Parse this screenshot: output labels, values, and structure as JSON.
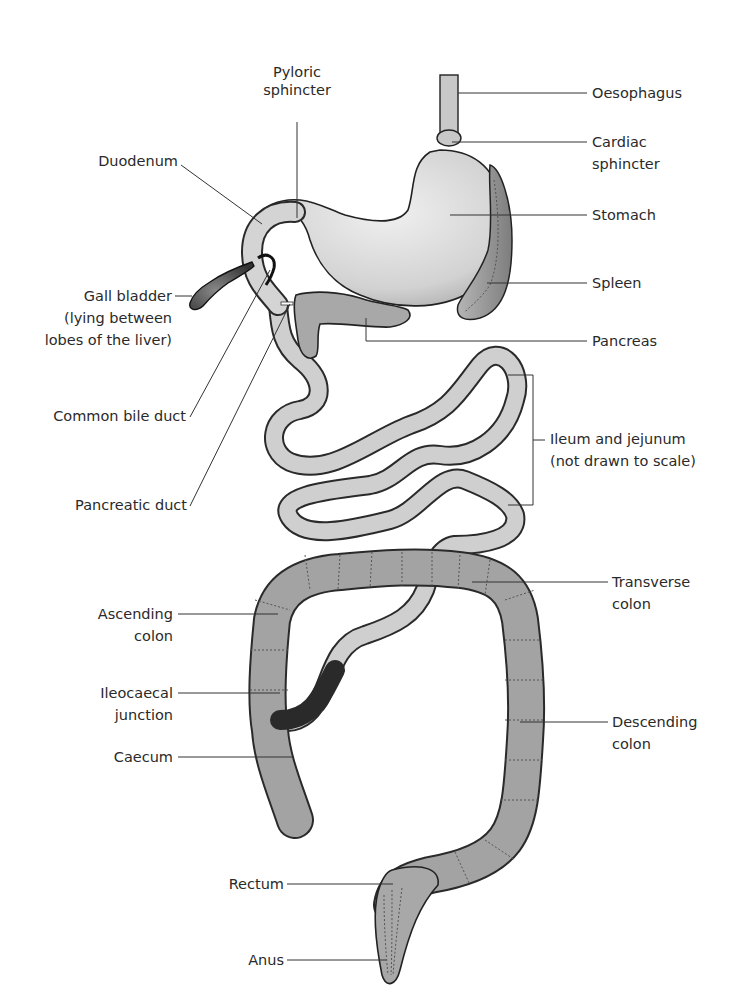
{
  "diagram": {
    "labels": {
      "pyloric_sphincter": [
        "Pyloric",
        "sphincter"
      ],
      "oesophagus": "Oesophagus",
      "cardiac_sphincter": [
        "Cardiac",
        "sphincter"
      ],
      "duodenum": "Duodenum",
      "stomach": "Stomach",
      "spleen": "Spleen",
      "gall_bladder": [
        "Gall bladder",
        "(lying between",
        "lobes of the liver)"
      ],
      "pancreas": "Pancreas",
      "common_bile_duct": "Common bile duct",
      "ileum_jejunum": [
        "Ileum and jejunum",
        "(not drawn to scale)"
      ],
      "pancreatic_duct": "Pancreatic duct",
      "transverse_colon": [
        "Transverse",
        "colon"
      ],
      "ascending_colon": [
        "Ascending",
        "colon"
      ],
      "ileocaecal_junction": [
        "Ileocaecal",
        "junction"
      ],
      "descending_colon": [
        "Descending",
        "colon"
      ],
      "caecum": "Caecum",
      "rectum": "Rectum",
      "anus": "Anus"
    },
    "colors": {
      "light_organ": "#d9d9d9",
      "mid_organ": "#a8a8a8",
      "dark_organ": "#555555",
      "outline": "#222222",
      "text": "#2a2a2a"
    }
  }
}
